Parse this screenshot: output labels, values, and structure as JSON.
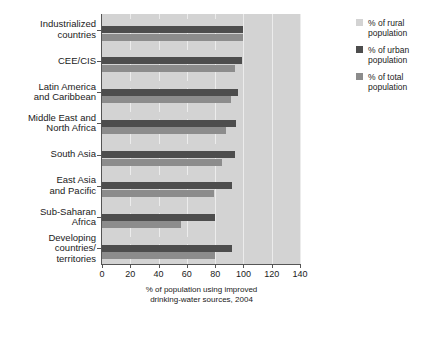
{
  "chart_data": {
    "type": "bar",
    "orientation": "horizontal",
    "title": "",
    "xlabel": "% of population using improved drinking-water sources, 2004",
    "ylabel": "",
    "xlim": [
      0,
      140
    ],
    "xticks": [
      0,
      20,
      40,
      60,
      80,
      100,
      120,
      140
    ],
    "grid": true,
    "grid_axis": "x",
    "legend_position": "right",
    "categories": [
      "Industrialized countries",
      "CEE/CIS",
      "Latin America and Caribbean",
      "Middle East and North Africa",
      "South Asia",
      "East Asia and Pacific",
      "Sub-Saharan Africa",
      "Developing countries/ territories"
    ],
    "series": [
      {
        "name": "% of rural population",
        "color": "#d3d3d3",
        "values": [
          100,
          91,
          73,
          78,
          81,
          69,
          42,
          70
        ]
      },
      {
        "name": "% of urban population",
        "color": "#4d4d4d",
        "values": [
          100,
          99,
          96,
          95,
          94,
          92,
          80,
          92
        ]
      },
      {
        "name": "% of total population",
        "color": "#8c8c8c",
        "values": [
          100,
          94,
          91,
          88,
          85,
          79,
          56,
          80
        ]
      }
    ]
  },
  "category_labels": [
    [
      "Industrialized",
      "countries"
    ],
    [
      "CEE/CIS"
    ],
    [
      "Latin America",
      "and Caribbean"
    ],
    [
      "Middle East and",
      "North Africa"
    ],
    [
      "South Asia"
    ],
    [
      "East Asia",
      "and Pacific"
    ],
    [
      "Sub-Saharan",
      "Africa"
    ],
    [
      "Developing",
      "countries/",
      "territories"
    ]
  ],
  "axis": {
    "x_title_line1": "% of population using improved",
    "x_title_line2": "drinking-water sources, 2004"
  },
  "legend": {
    "items": [
      {
        "label_line1": "% of rural",
        "label_line2": "population",
        "swatch": "rural"
      },
      {
        "label_line1": "% of urban",
        "label_line2": "population",
        "swatch": "urban"
      },
      {
        "label_line1": "% of total",
        "label_line2": "population",
        "swatch": "total"
      }
    ]
  },
  "colors": {
    "panel": "#d3d3d3",
    "rural": "#d3d3d3",
    "urban": "#4d4d4d",
    "total": "#8c8c8c",
    "grid": "#ececec",
    "axis": "#555555"
  }
}
